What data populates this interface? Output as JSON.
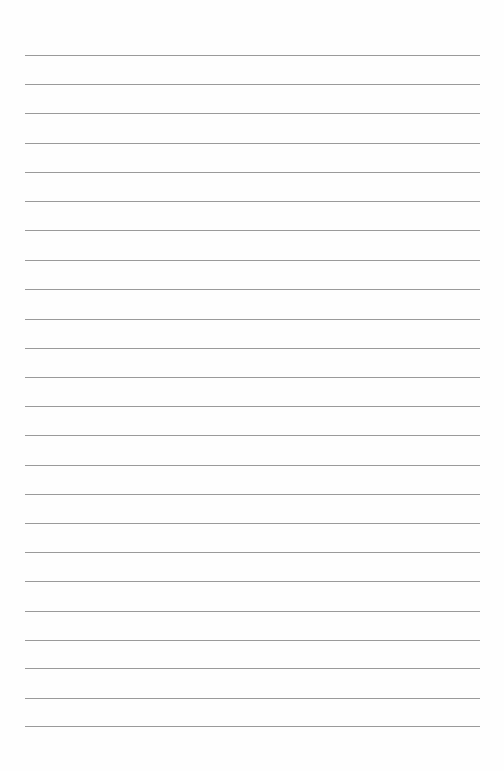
{
  "page": {
    "type": "lined-paper",
    "background_color": "#fefefe",
    "line_color": "#9a9a9a",
    "line_left": 25,
    "line_right": 480,
    "line_count": 24,
    "line_positions": [
      55,
      84,
      113,
      143,
      172,
      201,
      230,
      260,
      289,
      319,
      348,
      377,
      406,
      435,
      465,
      494,
      523,
      552,
      581,
      611,
      640,
      668,
      698,
      726
    ],
    "text": []
  }
}
